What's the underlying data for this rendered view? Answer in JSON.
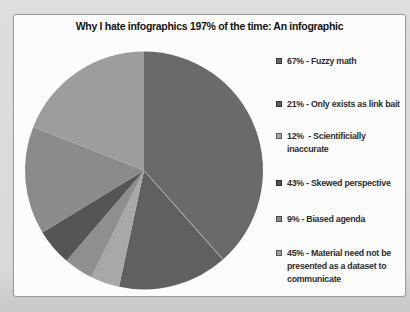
{
  "chart": {
    "title": "Why I hate infographics 197% of the time: An infographic"
  },
  "chart_data": {
    "type": "pie",
    "title": "Why I hate infographics 197% of the time: An infographic",
    "legend_position": "right",
    "categories": [
      "Fuzzy math",
      "Only exists as link bait",
      "Scientificially inaccurate",
      "Skewed perspective",
      "Biased agenda",
      "Material need not be presented as a dataset to communicate"
    ],
    "values": [
      67,
      21,
      12,
      43,
      9,
      45
    ],
    "legend": [
      {
        "label": "67% - Fuzzy math",
        "color": "#6a6a6a",
        "top": 55
      },
      {
        "label": "21% - Only exists as link bait",
        "color": "#606060",
        "top": 98
      },
      {
        "label": "12%  - Scientificially\ninaccurate",
        "color": "#a8a8a8",
        "top": 130
      },
      {
        "label": "43% - Skewed perspective",
        "color": "#555555",
        "top": 177
      },
      {
        "label": "9% - Biased agenda",
        "color": "#8b8b8b",
        "top": 213
      },
      {
        "label": "45% - Material need not be\npresented as a dataset to\ncommunicate",
        "color": "#9d9d9d",
        "top": 247
      }
    ],
    "pie_geometry": {
      "cx": 144,
      "cy": 170.5,
      "r": 119
    },
    "rendered_slices": [
      {
        "start_deg": 0,
        "end_deg": 138.4,
        "color": "#6a6a6a"
      },
      {
        "start_deg": 138.4,
        "end_deg": 192.1,
        "color": "#606060"
      },
      {
        "start_deg": 192.1,
        "end_deg": 206.2,
        "color": "#a8a8a8"
      },
      {
        "start_deg": 206.2,
        "end_deg": 220.6,
        "color": "#8f8f8f"
      },
      {
        "start_deg": 220.6,
        "end_deg": 238.6,
        "color": "#555555"
      },
      {
        "start_deg": 238.6,
        "end_deg": 291.4,
        "color": "#8b8b8b"
      },
      {
        "start_deg": 291.4,
        "end_deg": 360,
        "color": "#9d9d9d"
      }
    ],
    "separator_lines": [
      {
        "angle_deg": 138.4,
        "color": "#c2c2c2"
      }
    ]
  }
}
